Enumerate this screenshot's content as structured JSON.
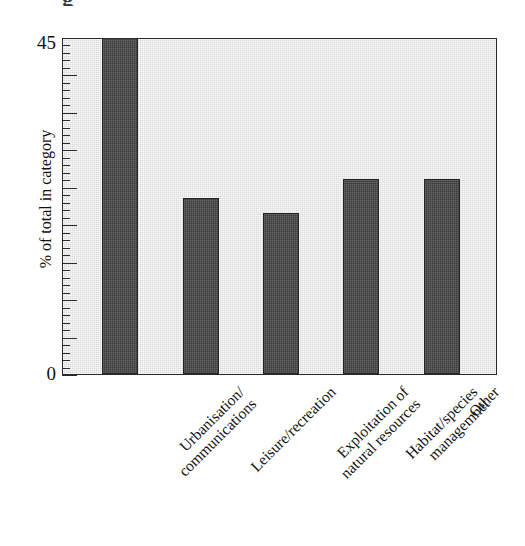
{
  "figure": {
    "title_partial": "g",
    "y_axis": {
      "title": "% of total in category",
      "labels": {
        "max": "45",
        "min": "0"
      }
    }
  },
  "chart_data": {
    "type": "bar",
    "title": "",
    "xlabel": "",
    "ylabel": "% of total in category",
    "ylim": [
      0,
      45
    ],
    "grid": false,
    "legend": "none",
    "tick_labels": [
      "0",
      "45"
    ],
    "bar_color": "#3c3c3c",
    "plot_background": "#d9d9d9",
    "categories": [
      "Urbanisation/ communications",
      "Leisure/recreation",
      "Exploitation of natural resources",
      "Habitat/species managemnet",
      "Other"
    ],
    "category_lines": [
      [
        "Urbanisation/",
        "communications"
      ],
      [
        "Leisure/recreation"
      ],
      [
        "Exploitation of",
        "natural resources"
      ],
      [
        "Habitat/species",
        "managemnet"
      ],
      [
        "Other"
      ]
    ],
    "values": [
      45,
      23.5,
      21.5,
      26,
      26
    ]
  }
}
